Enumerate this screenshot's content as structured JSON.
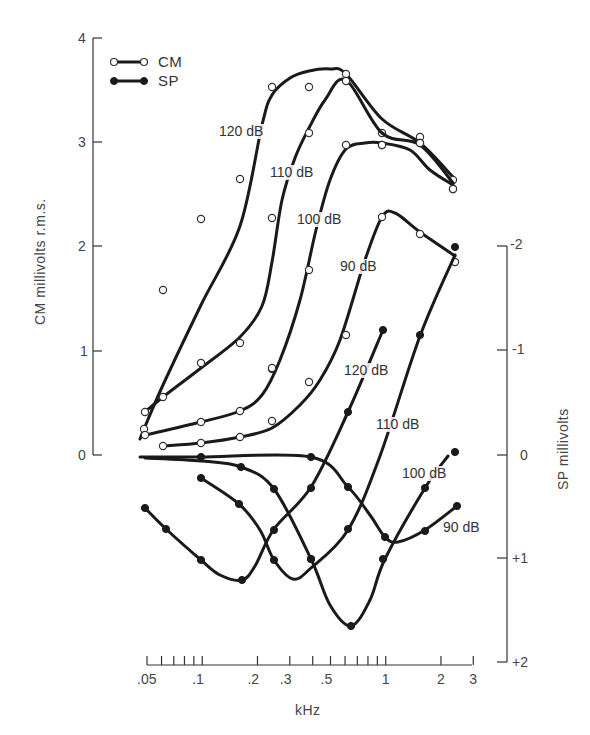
{
  "chart_data": {
    "type": "line",
    "title": "",
    "xlabel": "kHz",
    "xscale": "log",
    "xlim": [
      0.05,
      3
    ],
    "x_ticks": [
      {
        "value": 0.05,
        "label": ".05"
      },
      {
        "value": 0.1,
        "label": ".1"
      },
      {
        "value": 0.2,
        "label": ".2"
      },
      {
        "value": 0.3,
        "label": ".3"
      },
      {
        "value": 0.5,
        "label": ".5"
      },
      {
        "value": 1,
        "label": "1"
      },
      {
        "value": 2,
        "label": "2"
      },
      {
        "value": 3,
        "label": "3"
      }
    ],
    "x_minor_ticks": [
      0.06,
      0.07,
      0.08,
      0.09,
      0.4,
      0.6,
      0.7,
      0.8,
      0.9
    ],
    "ylabel_left": "CM millivolts r.m.s.",
    "ylim_left": [
      0,
      4
    ],
    "y_ticks_left": [
      {
        "value": 0,
        "label": "0"
      },
      {
        "value": 1,
        "label": "1"
      },
      {
        "value": 2,
        "label": "2"
      },
      {
        "value": 3,
        "label": "3"
      },
      {
        "value": 4,
        "label": "4"
      }
    ],
    "ylabel_right": "SP millivolts",
    "ylim_right": [
      -2,
      2
    ],
    "y_right_inverted": true,
    "y_ticks_right": [
      {
        "value": -2,
        "label": "-2"
      },
      {
        "value": -1,
        "label": "-1"
      },
      {
        "value": 0,
        "label": "0"
      },
      {
        "value": 1,
        "label": "+1"
      },
      {
        "value": 2,
        "label": "+2"
      }
    ],
    "grid": false,
    "legend": {
      "position": "top-left",
      "entries": [
        {
          "name": "CM",
          "marker": "open-circle"
        },
        {
          "name": "SP",
          "marker": "filled-circle"
        }
      ]
    },
    "series": [
      {
        "name": "CM 120 dB",
        "group": "CM",
        "axis": "left",
        "label": "120 dB",
        "x": [
          0.048,
          0.061,
          0.099,
          0.16,
          0.24,
          0.38,
          0.62,
          0.96,
          1.55,
          2.4
        ],
        "y": [
          1.05,
          1.6,
          2.27,
          2.65,
          3.5,
          3.5,
          3.65,
          3.07,
          3.05,
          2.65
        ]
      },
      {
        "name": "CM 110 dB",
        "group": "CM",
        "axis": "left",
        "label": "110 dB",
        "x": [
          0.048,
          0.061,
          0.099,
          0.16,
          0.24,
          0.38,
          0.62,
          0.96,
          1.55,
          2.4
        ],
        "y": [
          0.42,
          0.56,
          0.88,
          1.07,
          2.27,
          3.33,
          3.58,
          3.07,
          3.0,
          2.6
        ]
      },
      {
        "name": "CM 100 dB",
        "group": "CM",
        "axis": "left",
        "label": "100 dB",
        "x": [
          0.048,
          0.099,
          0.16,
          0.24,
          0.38,
          0.62,
          0.96,
          1.55,
          2.4
        ],
        "y": [
          0.2,
          0.32,
          0.42,
          0.84,
          1.78,
          2.97,
          2.97,
          2.95,
          2.55
        ]
      },
      {
        "name": "CM 90 dB",
        "group": "CM",
        "axis": "left",
        "label": "90 dB",
        "x": [
          0.061,
          0.099,
          0.16,
          0.24,
          0.38,
          0.62,
          0.96,
          1.55,
          2.4
        ],
        "y": [
          0.09,
          0.12,
          0.18,
          0.33,
          0.7,
          1.41,
          2.28,
          2.13,
          1.88
        ]
      },
      {
        "name": "SP 120 dB",
        "group": "SP",
        "axis": "right",
        "label": "120 dB",
        "x": [
          0.048,
          0.061,
          0.099,
          0.16,
          0.24,
          0.38,
          0.62,
          1.0
        ],
        "y": [
          0.5,
          0.71,
          1.01,
          1.2,
          0.71,
          0.31,
          -0.41,
          -1.2
        ]
      },
      {
        "name": "SP 110 dB",
        "group": "SP",
        "axis": "right",
        "label": "110 dB",
        "x": [
          0.099,
          0.16,
          0.24,
          0.3,
          0.38,
          0.62,
          0.96,
          1.55,
          2.4
        ],
        "y": [
          0.22,
          0.47,
          1.01,
          1.19,
          1.0,
          0.71,
          -0.02,
          -1.15,
          -1.99
        ]
      },
      {
        "name": "SP 100 dB",
        "group": "SP",
        "axis": "right",
        "label": "100 dB",
        "x": [
          0.099,
          0.16,
          0.24,
          0.38,
          0.65,
          0.96,
          1.6,
          2.3
        ],
        "y": [
          0.02,
          0.11,
          0.33,
          1.0,
          1.65,
          1.0,
          0.32,
          -0.08
        ]
      },
      {
        "name": "SP 90 dB",
        "group": "SP",
        "axis": "right",
        "label": "90 dB",
        "x": [
          0.05,
          0.38,
          0.62,
          0.99,
          1.15,
          1.6,
          2.5
        ],
        "y": [
          0.0,
          0.0,
          0.31,
          0.8,
          0.84,
          0.73,
          0.49
        ]
      }
    ]
  },
  "pixels": {
    "cm": [
      {
        "label": "120 dB",
        "labelPos": [
          219,
          136
        ],
        "line": [
          [
            140,
            439
          ],
          [
            144,
            429
          ],
          [
            163,
            385
          ],
          [
            201,
            305
          ],
          [
            240,
            226
          ],
          [
            262,
            125
          ],
          [
            272,
            95
          ],
          [
            290,
            78
          ],
          [
            309,
            71
          ],
          [
            330,
            69
          ],
          [
            346,
            74
          ],
          [
            382,
            119
          ],
          [
            420,
            143
          ],
          [
            453,
            177
          ]
        ],
        "points": [
          [
            144,
            429
          ],
          [
            163,
            290
          ],
          [
            201,
            219
          ],
          [
            240,
            179
          ],
          [
            272,
            87
          ],
          [
            309,
            87
          ],
          [
            346,
            74
          ],
          [
            382,
            133
          ],
          [
            420,
            137
          ],
          [
            453,
            180
          ]
        ]
      },
      {
        "label": "110 dB",
        "labelPos": [
          270,
          177
        ],
        "line": [
          [
            145,
            412
          ],
          [
            163,
            397
          ],
          [
            201,
            368
          ],
          [
            240,
            337
          ],
          [
            262,
            306
          ],
          [
            272,
            262
          ],
          [
            282,
            200
          ],
          [
            295,
            158
          ],
          [
            309,
            128
          ],
          [
            325,
            100
          ],
          [
            346,
            80
          ],
          [
            382,
            133
          ],
          [
            420,
            145
          ],
          [
            453,
            183
          ]
        ],
        "points": [
          [
            145,
            412
          ],
          [
            163,
            397
          ],
          [
            201,
            363
          ],
          [
            240,
            343
          ],
          [
            272,
            369
          ],
          [
            272,
            218
          ],
          [
            309,
            133
          ],
          [
            346,
            81
          ],
          [
            382,
            145
          ],
          [
            420,
            143
          ],
          [
            453,
            189
          ]
        ]
      },
      {
        "label": "100 dB",
        "labelPos": [
          297,
          224
        ],
        "line": [
          [
            145,
            435
          ],
          [
            201,
            422
          ],
          [
            240,
            411
          ],
          [
            262,
            395
          ],
          [
            280,
            360
          ],
          [
            300,
            300
          ],
          [
            316,
            230
          ],
          [
            330,
            180
          ],
          [
            346,
            149
          ],
          [
            365,
            143
          ],
          [
            382,
            143
          ],
          [
            410,
            150
          ],
          [
            430,
            170
          ],
          [
            453,
            185
          ]
        ],
        "points": [
          [
            145,
            435
          ],
          [
            201,
            422
          ],
          [
            240,
            411
          ],
          [
            272,
            368
          ],
          [
            309,
            270
          ],
          [
            346,
            145
          ],
          [
            382,
            145
          ],
          [
            420,
            143
          ],
          [
            453,
            189
          ]
        ]
      },
      {
        "label": "90 dB",
        "labelPos": [
          340,
          271
        ],
        "line": [
          [
            163,
            446
          ],
          [
            201,
            443
          ],
          [
            240,
            437
          ],
          [
            272,
            428
          ],
          [
            300,
            405
          ],
          [
            320,
            380
          ],
          [
            340,
            340
          ],
          [
            365,
            260
          ],
          [
            382,
            217
          ],
          [
            395,
            213
          ],
          [
            420,
            232
          ],
          [
            455,
            256
          ]
        ],
        "points": [
          [
            163,
            446
          ],
          [
            201,
            443
          ],
          [
            240,
            437
          ],
          [
            272,
            421
          ],
          [
            309,
            382
          ],
          [
            346,
            335
          ],
          [
            382,
            217
          ],
          [
            420,
            234
          ],
          [
            455,
            262
          ]
        ]
      }
    ],
    "sp": [
      {
        "label": "120 dB",
        "labelPos": [
          344,
          375
        ],
        "line": [
          [
            145,
            508
          ],
          [
            166,
            529
          ],
          [
            201,
            560
          ],
          [
            220,
            575
          ],
          [
            242,
            580
          ],
          [
            255,
            566
          ],
          [
            274,
            529
          ],
          [
            311,
            487
          ],
          [
            348,
            412
          ],
          [
            383,
            330
          ]
        ],
        "points": [
          [
            145,
            508
          ],
          [
            166,
            529
          ],
          [
            201,
            560
          ],
          [
            242,
            580
          ],
          [
            274,
            530
          ],
          [
            311,
            488
          ],
          [
            348,
            412
          ],
          [
            383,
            330
          ]
        ]
      },
      {
        "label": "110 dB",
        "labelPos": [
          376,
          429
        ],
        "line": [
          [
            201,
            478
          ],
          [
            239,
            504
          ],
          [
            260,
            530
          ],
          [
            274,
            560
          ],
          [
            293,
            579
          ],
          [
            311,
            568
          ],
          [
            348,
            530
          ],
          [
            380,
            456
          ],
          [
            420,
            336
          ],
          [
            455,
            255
          ]
        ],
        "points": [
          [
            201,
            478
          ],
          [
            239,
            504
          ],
          [
            274,
            560
          ],
          [
            311,
            559
          ],
          [
            348,
            529
          ],
          [
            420,
            335
          ],
          [
            455,
            247
          ]
        ]
      },
      {
        "label": "100 dB",
        "labelPos": [
          402,
          478
        ],
        "line": [
          [
            145,
            458
          ],
          [
            201,
            461
          ],
          [
            241,
            467
          ],
          [
            274,
            489
          ],
          [
            311,
            559
          ],
          [
            330,
            605
          ],
          [
            351,
            626
          ],
          [
            370,
            600
          ],
          [
            385,
            559
          ],
          [
            425,
            488
          ],
          [
            448,
            456
          ]
        ],
        "points": [
          [
            201,
            457
          ],
          [
            241,
            467
          ],
          [
            274,
            489
          ],
          [
            311,
            559
          ],
          [
            351,
            626
          ],
          [
            383,
            559
          ],
          [
            425,
            488
          ],
          [
            455,
            452
          ]
        ]
      },
      {
        "label": "90 dB",
        "labelPos": [
          443,
          532
        ],
        "line": [
          [
            140,
            457
          ],
          [
            200,
            457
          ],
          [
            311,
            457
          ],
          [
            348,
            487
          ],
          [
            370,
            515
          ],
          [
            385,
            537
          ],
          [
            398,
            542
          ],
          [
            425,
            530
          ],
          [
            457,
            506
          ]
        ],
        "points": [
          [
            311,
            457
          ],
          [
            348,
            487
          ],
          [
            385,
            537
          ],
          [
            425,
            531
          ],
          [
            457,
            506
          ]
        ]
      }
    ]
  }
}
